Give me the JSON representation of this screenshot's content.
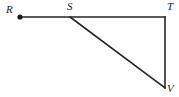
{
  "figure": {
    "type": "geometry-diagram",
    "background_color": "#ffffff",
    "stroke_color": "#262626",
    "stroke_width": 1.6,
    "canvas": {
      "width": 179,
      "height": 97
    },
    "points": {
      "R": {
        "label": "R",
        "x": 20,
        "y": 17,
        "has_dot": true,
        "dot_radius": 2.6
      },
      "S": {
        "label": "S",
        "x": 70,
        "y": 17,
        "has_dot": false,
        "dot_radius": 0
      },
      "T": {
        "label": "T",
        "x": 165,
        "y": 17,
        "has_dot": false,
        "dot_radius": 0
      },
      "V": {
        "label": "V",
        "x": 165,
        "y": 88,
        "has_dot": false,
        "dot_radius": 0
      }
    },
    "segments": [
      {
        "name": "RT",
        "from": "R",
        "to": "T"
      },
      {
        "name": "TV",
        "from": "T",
        "to": "V"
      },
      {
        "name": "SV",
        "from": "S",
        "to": "V"
      }
    ],
    "labels": {
      "R": "R",
      "S": "S",
      "T": "T",
      "V": "V"
    }
  }
}
